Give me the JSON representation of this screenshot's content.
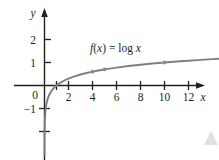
{
  "chart_data": {
    "type": "line",
    "title": "",
    "subtitle": "",
    "xlabel": "x",
    "ylabel": "y",
    "xlim": [
      -1.2,
      14.6
    ],
    "ylim": [
      -2.9,
      2.7
    ],
    "grid": false,
    "legend_position": "inline-annotation",
    "x_ticks": [
      2,
      4,
      6,
      8,
      10,
      12
    ],
    "x_tick_labels": [
      "2",
      "4",
      "6",
      "8",
      "10",
      "12"
    ],
    "x_minor_ticks": [
      1
    ],
    "y_ticks": [
      2,
      1,
      -1,
      -2
    ],
    "y_tick_labels": [
      "2",
      "1",
      "−1",
      "−2"
    ],
    "origin_label": "0",
    "annotations": [
      {
        "name": "function-equation",
        "text": "f(x) = log x",
        "text_parts": [
          "f",
          "(",
          "x",
          ")",
          " = ",
          "log",
          " ",
          "x"
        ],
        "x": 5.0,
        "y": 1.62
      }
    ],
    "series": [
      {
        "name": "f(x) = log x",
        "type": "line",
        "color": "#7f7f7f",
        "x": [
          0.001,
          0.0018,
          0.003,
          0.006,
          0.012,
          0.025,
          0.05,
          0.09,
          0.15,
          0.25,
          0.4,
          0.6,
          0.8,
          1.0,
          1.3,
          1.7,
          2.0,
          2.5,
          3.0,
          3.5,
          4.0,
          4.5,
          5.0,
          6.0,
          7.0,
          8.0,
          9.0,
          10.0,
          11.0,
          12.0,
          13.0,
          14.0,
          14.6
        ],
        "y": [
          -3.0,
          -2.745,
          -2.523,
          -2.222,
          -1.921,
          -1.602,
          -1.301,
          -1.046,
          -0.824,
          -0.602,
          -0.398,
          -0.222,
          -0.097,
          0.0,
          0.114,
          0.23,
          0.301,
          0.398,
          0.477,
          0.544,
          0.602,
          0.653,
          0.699,
          0.778,
          0.845,
          0.903,
          0.954,
          1.0,
          1.041,
          1.079,
          1.114,
          1.146,
          1.164
        ]
      }
    ],
    "markers": [
      {
        "name": "point-4",
        "x": 4,
        "y": 0.602
      },
      {
        "name": "point-5",
        "x": 5,
        "y": 0.699
      },
      {
        "name": "point-10",
        "x": 10,
        "y": 1.0
      }
    ],
    "colors": {
      "axis": "#231f20",
      "curve": "#7f7f7f",
      "marker": "#8c8c8c",
      "text": "#231f20",
      "background": "#ffffff",
      "corner_artifact": "#d8d8d8"
    }
  }
}
